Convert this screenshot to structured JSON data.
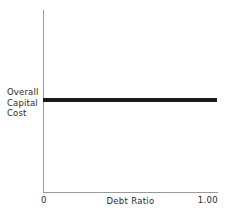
{
  "chart_data": {
    "type": "line",
    "title": "",
    "xlabel": "Debt Ratio",
    "ylabel": "Overall Capital Cost",
    "ylabel_lines": [
      "Overall",
      "Capital",
      "Cost"
    ],
    "x_tick_labels": [
      "0",
      "1.00"
    ],
    "y_tick_labels": [],
    "xlim": [
      0,
      1.0
    ],
    "ylim": [
      0,
      1.0
    ],
    "grid": false,
    "legend": false,
    "series": [
      {
        "name": "Overall Capital Cost",
        "x": [
          0,
          1.0
        ],
        "values": [
          0.5,
          0.5
        ],
        "color": "#1a1a1a",
        "note": "flat horizontal line - overall capital cost constant across all debt ratios"
      }
    ],
    "axis_color": "#9a9a9a",
    "background": "#ffffff"
  }
}
